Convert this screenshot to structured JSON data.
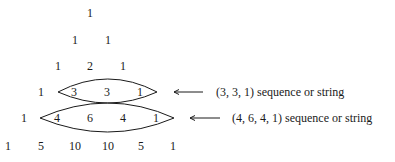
{
  "diagram": {
    "rows": [
      [
        "1"
      ],
      [
        "1",
        "1"
      ],
      [
        "1",
        "2",
        "1"
      ],
      [
        "1",
        "3",
        "3",
        "1"
      ],
      [
        "1",
        "4",
        "6",
        "4",
        "1"
      ],
      [
        "1",
        "5",
        "10",
        "10",
        "5",
        "1"
      ]
    ],
    "annotations": [
      {
        "label": "(3, 3, 1) sequence or string",
        "highlighted_row": 3,
        "highlighted": [
          "3",
          "3",
          "1"
        ]
      },
      {
        "label": "(4, 6, 4, 1) sequence or string",
        "highlighted_row": 4,
        "highlighted": [
          "4",
          "6",
          "4",
          "1"
        ]
      }
    ]
  }
}
